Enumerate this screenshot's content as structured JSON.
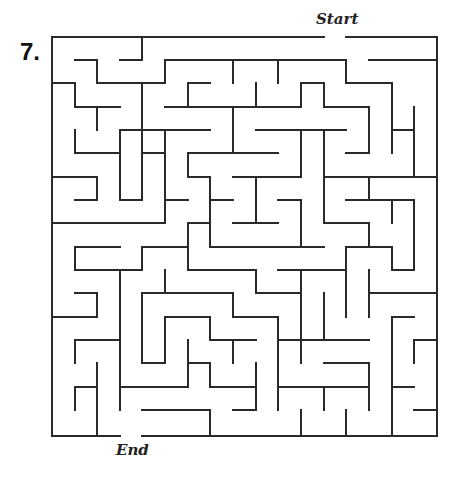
{
  "puzzle": {
    "number_label": "7.",
    "start_label": "Start",
    "end_label": "End"
  },
  "maze": {
    "grid": {
      "cols": 17,
      "rows": 17,
      "x_lines": [
        52,
        75,
        97,
        120,
        142,
        165,
        188,
        210,
        233,
        256,
        278,
        301,
        324,
        346,
        369,
        392,
        414,
        437
      ],
      "y_lines": [
        37,
        60,
        83,
        107,
        130,
        153,
        177,
        200,
        223,
        247,
        270,
        293,
        317,
        340,
        363,
        387,
        410,
        436
      ]
    },
    "wall_color": "#2a2a2a",
    "openings": {
      "start": {
        "side": "top",
        "from_col": 12,
        "to_col": 13
      },
      "end": {
        "side": "bottom",
        "from_col": 3,
        "to_col": 4
      }
    },
    "walls": [
      [
        0,
        0,
        12,
        0
      ],
      [
        13,
        0,
        17,
        0
      ],
      [
        0,
        0,
        0,
        17
      ],
      [
        17,
        0,
        17,
        17
      ],
      [
        0,
        17,
        3,
        17
      ],
      [
        4,
        17,
        17,
        17
      ],
      [
        4,
        0,
        4,
        1
      ],
      [
        3,
        1,
        4,
        1
      ],
      [
        1,
        1,
        2,
        1
      ],
      [
        2,
        1,
        2,
        2
      ],
      [
        2,
        2,
        5,
        2
      ],
      [
        5,
        1,
        5,
        2
      ],
      [
        5,
        1,
        13,
        1
      ],
      [
        8,
        1,
        8,
        2
      ],
      [
        10,
        1,
        10,
        2
      ],
      [
        13,
        1,
        13,
        2
      ],
      [
        13,
        2,
        15,
        2
      ],
      [
        15,
        2,
        15,
        5
      ],
      [
        14,
        1,
        17,
        1
      ],
      [
        16,
        3,
        16,
        4
      ],
      [
        15,
        4,
        16,
        4
      ],
      [
        0,
        2,
        1,
        2
      ],
      [
        1,
        2,
        1,
        3
      ],
      [
        1,
        3,
        3,
        3
      ],
      [
        2,
        3,
        2,
        4
      ],
      [
        4,
        2,
        4,
        6
      ],
      [
        6,
        2,
        7,
        2
      ],
      [
        6,
        2,
        6,
        3
      ],
      [
        9,
        2,
        9,
        3
      ],
      [
        11,
        2,
        12,
        2
      ],
      [
        11,
        2,
        11,
        3
      ],
      [
        12,
        2,
        12,
        3
      ],
      [
        5,
        3,
        11,
        3
      ],
      [
        12,
        3,
        14,
        3
      ],
      [
        14,
        3,
        14,
        5
      ],
      [
        13,
        5,
        14,
        5
      ],
      [
        8,
        3,
        8,
        5
      ],
      [
        3,
        4,
        5,
        4
      ],
      [
        5,
        4,
        7,
        4
      ],
      [
        9,
        4,
        13,
        4
      ],
      [
        3,
        4,
        3,
        7
      ],
      [
        5,
        4,
        5,
        8
      ],
      [
        1,
        4,
        1,
        5
      ],
      [
        1,
        5,
        3,
        5
      ],
      [
        4,
        5,
        5,
        5
      ],
      [
        11,
        4,
        11,
        6
      ],
      [
        12,
        4,
        12,
        8
      ],
      [
        16,
        4,
        16,
        6
      ],
      [
        6,
        5,
        10,
        5
      ],
      [
        6,
        5,
        6,
        6
      ],
      [
        6,
        6,
        7,
        6
      ],
      [
        7,
        6,
        7,
        9
      ],
      [
        8,
        6,
        11,
        6
      ],
      [
        9,
        6,
        9,
        8
      ],
      [
        8,
        8,
        10,
        8
      ],
      [
        10,
        6,
        11,
        6
      ],
      [
        12,
        6,
        17,
        6
      ],
      [
        14,
        6,
        14,
        7
      ],
      [
        13,
        7,
        16,
        7
      ],
      [
        15,
        7,
        15,
        8
      ],
      [
        16,
        7,
        16,
        10
      ],
      [
        15,
        10,
        16,
        10
      ],
      [
        0,
        6,
        2,
        6
      ],
      [
        2,
        6,
        2,
        7
      ],
      [
        1,
        7,
        2,
        7
      ],
      [
        3,
        7,
        4,
        7
      ],
      [
        4,
        6,
        4,
        7
      ],
      [
        5,
        7,
        6,
        7
      ],
      [
        7,
        7,
        8,
        7
      ],
      [
        10,
        7,
        11,
        7
      ],
      [
        11,
        7,
        11,
        9
      ],
      [
        12,
        8,
        13,
        8
      ],
      [
        0,
        8,
        5,
        8
      ],
      [
        6,
        8,
        7,
        8
      ],
      [
        6,
        8,
        6,
        10
      ],
      [
        1,
        9,
        3,
        9
      ],
      [
        1,
        9,
        1,
        10
      ],
      [
        1,
        10,
        4,
        10
      ],
      [
        4,
        9,
        4,
        10
      ],
      [
        4,
        9,
        6,
        9
      ],
      [
        7,
        9,
        12,
        9
      ],
      [
        10,
        9,
        12,
        9
      ],
      [
        13,
        8,
        14,
        8
      ],
      [
        14,
        8,
        14,
        9
      ],
      [
        13,
        9,
        15,
        9
      ],
      [
        15,
        9,
        15,
        10
      ],
      [
        13,
        9,
        13,
        12
      ],
      [
        3,
        10,
        3,
        16
      ],
      [
        5,
        10,
        5,
        11
      ],
      [
        6,
        10,
        9,
        10
      ],
      [
        9,
        10,
        9,
        11
      ],
      [
        9,
        11,
        11,
        11
      ],
      [
        10,
        10,
        13,
        10
      ],
      [
        11,
        10,
        11,
        12
      ],
      [
        14,
        10,
        14,
        12
      ],
      [
        14,
        11,
        17,
        11
      ],
      [
        10,
        11,
        11,
        11
      ],
      [
        1,
        11,
        2,
        11
      ],
      [
        2,
        11,
        2,
        12
      ],
      [
        0,
        12,
        2,
        12
      ],
      [
        4,
        11,
        8,
        11
      ],
      [
        4,
        11,
        4,
        14
      ],
      [
        4,
        14,
        5,
        14
      ],
      [
        5,
        12,
        5,
        14
      ],
      [
        5,
        12,
        7,
        12
      ],
      [
        7,
        12,
        7,
        13
      ],
      [
        7,
        13,
        9,
        13
      ],
      [
        8,
        11,
        8,
        12
      ],
      [
        8,
        12,
        10,
        12
      ],
      [
        10,
        12,
        10,
        16
      ],
      [
        8,
        13,
        8,
        14
      ],
      [
        11,
        12,
        11,
        13
      ],
      [
        12,
        11,
        12,
        13
      ],
      [
        10,
        13,
        14,
        13
      ],
      [
        15,
        12,
        16,
        12
      ],
      [
        15,
        12,
        15,
        17
      ],
      [
        1,
        13,
        3,
        13
      ],
      [
        1,
        13,
        1,
        14
      ],
      [
        6,
        13,
        6,
        15
      ],
      [
        6,
        14,
        7,
        14
      ],
      [
        7,
        14,
        7,
        15
      ],
      [
        7,
        15,
        9,
        15
      ],
      [
        9,
        14,
        9,
        16
      ],
      [
        8,
        16,
        9,
        16
      ],
      [
        11,
        13,
        11,
        14
      ],
      [
        12,
        14,
        14,
        14
      ],
      [
        14,
        14,
        14,
        16
      ],
      [
        16,
        13,
        16,
        14
      ],
      [
        16,
        13,
        17,
        13
      ],
      [
        2,
        14,
        2,
        17
      ],
      [
        1,
        15,
        2,
        15
      ],
      [
        1,
        15,
        1,
        16
      ],
      [
        3,
        15,
        6,
        15
      ],
      [
        10,
        15,
        11,
        15
      ],
      [
        10,
        15,
        14,
        15
      ],
      [
        12,
        15,
        12,
        16
      ],
      [
        15,
        15,
        16,
        15
      ],
      [
        4,
        16,
        7,
        16
      ],
      [
        7,
        16,
        7,
        17
      ],
      [
        16,
        16,
        17,
        16
      ],
      [
        11,
        16,
        11,
        17
      ],
      [
        13,
        16,
        13,
        17
      ]
    ]
  }
}
